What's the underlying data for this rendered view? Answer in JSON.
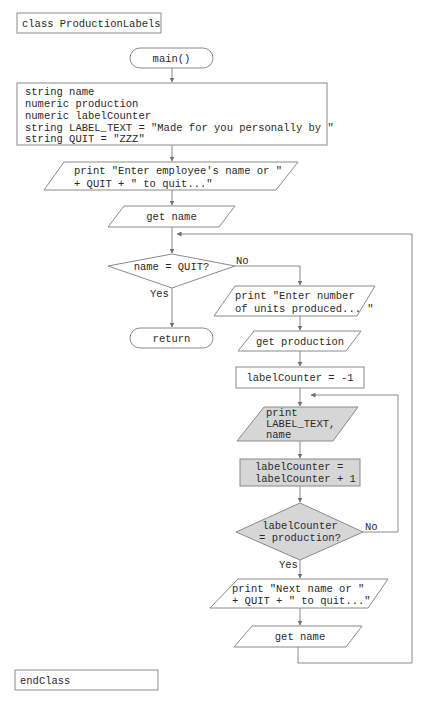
{
  "diagram": {
    "type": "flowchart",
    "class_header": "class ProductionLabels",
    "class_footer": "endClass",
    "terminals": {
      "start": "main()",
      "end": "return"
    },
    "declarations": [
      "string name",
      "numeric production",
      "numeric labelCounter",
      "string LABEL_TEXT = \"Made for you personally by \"",
      "string QUIT = \"ZZZ\""
    ],
    "prompt1": [
      "print \"Enter employee's name or \"",
      "+ QUIT + \" to quit...\""
    ],
    "get_name_1": "get name",
    "decision_quit": "name = QUIT?",
    "decision_quit_yes": "Yes",
    "decision_quit_no": "No",
    "prompt2": [
      "print \"Enter number",
      "of units produced... \""
    ],
    "get_production": "get production",
    "init_counter": "labelCounter = -1",
    "print_label": [
      "print",
      "LABEL_TEXT,",
      "name"
    ],
    "increment": [
      "labelCounter =",
      "labelCounter + 1"
    ],
    "decision_counter": [
      "labelCounter",
      "= production?"
    ],
    "decision_counter_yes": "Yes",
    "decision_counter_no": "No",
    "prompt3": [
      "print \"Next name or \"",
      "+ QUIT + \" to quit...\""
    ],
    "get_name_2": "get name",
    "colors": {
      "stroke": "#8a8a8a",
      "shaded_fill": "#d6d6d6",
      "text": "#2a2a2a"
    }
  }
}
